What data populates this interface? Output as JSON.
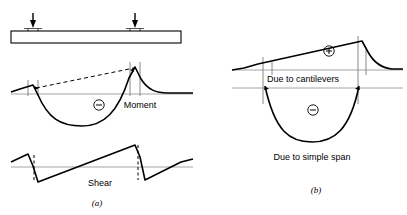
{
  "figure": {
    "title_a": "(a)",
    "title_b": "(b)",
    "background_color": "#ffffff",
    "line_color": "#000000",
    "thin_line_color": "#808080"
  },
  "panel_a": {
    "name": "continuous-beam-moment-and-shear-diagrams",
    "label": "(a)",
    "beam": {
      "left": 11,
      "right": 181,
      "top": 31,
      "bottom": 43,
      "supports": [
        {
          "name": "left-support",
          "x": 33
        },
        {
          "name": "right-support",
          "x": 135
        }
      ],
      "loads": [
        {
          "name": "left-point-load",
          "x": 33,
          "arrow_top": 13,
          "arrow_bottom": 26
        },
        {
          "name": "right-point-load",
          "x": 135,
          "arrow_top": 13,
          "arrow_bottom": 26
        }
      ]
    },
    "moment_diagram": {
      "label": "Moment",
      "sign": "−",
      "sign_meaning": "negative",
      "baseline_y": 94,
      "left_peak_x": 33,
      "left_peak_y": 86,
      "right_peak_x": 135,
      "right_peak_y": 67,
      "sag_min_y": 124,
      "chord_style": "dashed"
    },
    "shear_diagram": {
      "label": "Shear",
      "baseline_y": 167,
      "jump_style": "dashed"
    }
  },
  "panel_b": {
    "name": "superposed-moment-diagram",
    "label": "(b)",
    "cantilever_component": {
      "label": "Due to cantilevers",
      "sign": "+",
      "sign_meaning": "positive",
      "baseline_y": 70,
      "left_peak_x": 267,
      "left_peak_y": 62,
      "right_peak_x": 362,
      "right_peak_y": 41
    },
    "simple_span_component": {
      "label": "Due to simple span",
      "sign": "−",
      "sign_meaning": "negative",
      "baseline_y": 88,
      "sag_min_y": 140
    }
  },
  "labels": {
    "moment": "Moment",
    "shear": "Shear",
    "due_to_cantilevers": "Due to cantilevers",
    "due_to_simple_span": "Due to simple span",
    "plus_sign": "+",
    "minus_sign": "−",
    "fig_a": "(a)",
    "fig_b": "(b)"
  }
}
